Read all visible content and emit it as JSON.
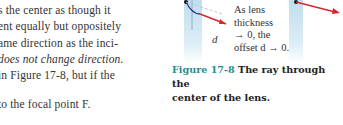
{
  "body_text": {
    "lines": [
      "s the center as though it",
      "ent equally but oppositely",
      "ame direction as the inci-",
      "does not change direction.",
      " in Figure 17-8, but if the"
    ],
    "after_gap": "to the focal point F."
  },
  "figure": {
    "annotation": [
      "As lens",
      "thickness",
      "→ 0, the",
      "offset d → 0."
    ],
    "offset_label": "d",
    "colors": {
      "ray": "#d9262e",
      "ray_dark": "#2b3a8c",
      "lens": "#bcdbec",
      "caption_num": "#1f8f8f"
    }
  },
  "caption": {
    "number": "Figure 17-8",
    "text_line1": " The ray through the",
    "text_line2": "center of the lens."
  }
}
